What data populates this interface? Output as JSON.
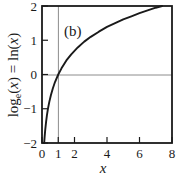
{
  "chart_data": {
    "type": "line",
    "title": "",
    "panel_label": "(b)",
    "xlabel": "x",
    "ylabel": "log_e(x) = ln(x)",
    "ylabel_parts": {
      "log": "log",
      "sub": "e",
      "open1": "(",
      "var1": "x",
      "close1": ")",
      "equals": " = ln",
      "open2": "(",
      "var2": "x",
      "close2": ")"
    },
    "xlim": [
      0,
      8
    ],
    "ylim": [
      -2,
      2
    ],
    "xticks": [
      0,
      1,
      2,
      4,
      6,
      8
    ],
    "xtick_labels": [
      "0",
      "1",
      "2",
      "4",
      "6",
      "8"
    ],
    "yticks": [
      -2,
      -1,
      0,
      1,
      2
    ],
    "ytick_labels": [
      "-2",
      "-1",
      "0",
      "1",
      "2"
    ],
    "grid": false,
    "reference_lines": [
      {
        "name": "y-zero-line",
        "orientation": "horizontal",
        "value": 0,
        "color": "#8c8c8c"
      },
      {
        "name": "x-one-line",
        "orientation": "vertical",
        "value": 1,
        "color": "#8c8c8c"
      }
    ],
    "series": [
      {
        "name": "ln(x)",
        "color": "#1a1a1a",
        "x": [
          0.135,
          0.16,
          0.2,
          0.25,
          0.3,
          0.37,
          0.45,
          0.55,
          0.67,
          0.8,
          1.0,
          1.2,
          1.5,
          1.8,
          2.2,
          2.6,
          3.0,
          3.5,
          4.0,
          4.5,
          5.0,
          5.5,
          6.0,
          6.5,
          7.0,
          7.39
        ],
        "y": [
          -2.0,
          -1.83,
          -1.61,
          -1.39,
          -1.2,
          -0.99,
          -0.8,
          -0.6,
          -0.4,
          -0.22,
          0.0,
          0.18,
          0.41,
          0.59,
          0.79,
          0.96,
          1.1,
          1.25,
          1.39,
          1.5,
          1.61,
          1.7,
          1.79,
          1.87,
          1.95,
          2.0
        ]
      }
    ],
    "legend": null,
    "colors": {
      "curve": "#1a1a1a",
      "frame": "#1a1a1a",
      "reference": "#8c8c8c",
      "background": "#ffffff",
      "text": "#1a1a1a"
    }
  }
}
